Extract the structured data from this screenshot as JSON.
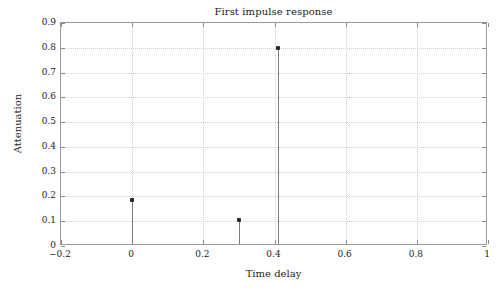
{
  "chart_data": {
    "type": "scatter",
    "plot_style": "stem",
    "title": "First impulse response",
    "xlabel": "Time delay",
    "ylabel": "Attenuation",
    "xlim": [
      -0.2,
      1
    ],
    "ylim": [
      0,
      0.9
    ],
    "xticks": [
      -0.2,
      0,
      0.2,
      0.4,
      0.6,
      0.8,
      1
    ],
    "xticklabels": [
      "−0.2",
      "0",
      "0.2",
      "0.4",
      "0.6",
      "0.8",
      "1"
    ],
    "yticks": [
      0,
      0.1,
      0.2,
      0.3,
      0.4,
      0.5,
      0.6,
      0.7,
      0.8,
      0.9
    ],
    "yticklabels": [
      "0",
      "0.1",
      "0.2",
      "0.3",
      "0.4",
      "0.5",
      "0.6",
      "0.7",
      "0.8",
      "0.9"
    ],
    "grid": true,
    "grid_style": "dotted",
    "legend": false,
    "series": [
      {
        "name": "impulse response",
        "x": [
          0,
          0.3,
          0.41
        ],
        "values": [
          0.185,
          0.105,
          0.8
        ]
      }
    ],
    "colors": {
      "marker": "#2b2b2b",
      "stem": "#7c7c7c",
      "grid": "#cfcfcf",
      "frame": "#9a9a9a",
      "text": "#222222",
      "background": "#ffffff"
    }
  }
}
